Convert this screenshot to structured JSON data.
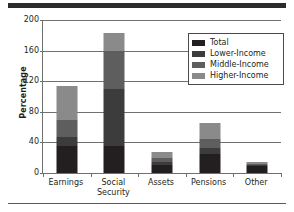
{
  "figure": {
    "rule_top": "decorative-rule",
    "rule_bottom": "decorative-rule"
  },
  "chart_data": {
    "type": "bar",
    "stacked": true,
    "title": "",
    "xlabel": "",
    "ylabel": "Percentage",
    "ylim": [
      0,
      200
    ],
    "yticks": [
      0,
      40,
      80,
      120,
      160,
      200
    ],
    "ytick_labels": [
      "0",
      "40",
      "80",
      "120",
      "160",
      "200"
    ],
    "grid": true,
    "grid_axis": "y",
    "legend_position": "upper right",
    "categories": [
      "Earnings",
      "Social Security",
      "Assets",
      "Pensions",
      "Other"
    ],
    "category_lines": [
      [
        "Earnings"
      ],
      [
        "Social",
        "Security"
      ],
      [
        "Assets"
      ],
      [
        "Pensions"
      ],
      [
        "Other"
      ]
    ],
    "series": [
      {
        "name": "Total",
        "color": "#231f20",
        "values": [
          35,
          35,
          11,
          25,
          9
        ]
      },
      {
        "name": "Lower-Income",
        "color": "#3c3c3c",
        "values": [
          12,
          75,
          4,
          8,
          1
        ]
      },
      {
        "name": "Middle-Income",
        "color": "#5e5e5e",
        "values": [
          22,
          50,
          5,
          12,
          2
        ]
      },
      {
        "name": "Higher-Income",
        "color": "#8a8a8a",
        "values": [
          45,
          23,
          7,
          20,
          2
        ]
      }
    ],
    "cumulative_tops": [
      [
        35,
        47,
        69,
        114
      ],
      [
        35,
        110,
        160,
        183
      ],
      [
        11,
        15,
        20,
        27
      ],
      [
        25,
        33,
        45,
        65
      ],
      [
        9,
        10,
        12,
        14
      ]
    ],
    "totals": [
      114,
      183,
      27,
      65,
      14
    ]
  },
  "legend": {
    "items": [
      {
        "label": "Total",
        "color": "#231f20"
      },
      {
        "label": "Lower-Income",
        "color": "#3c3c3c"
      },
      {
        "label": "Middle-Income",
        "color": "#5e5e5e"
      },
      {
        "label": "Higher-Income",
        "color": "#8a8a8a"
      }
    ]
  }
}
